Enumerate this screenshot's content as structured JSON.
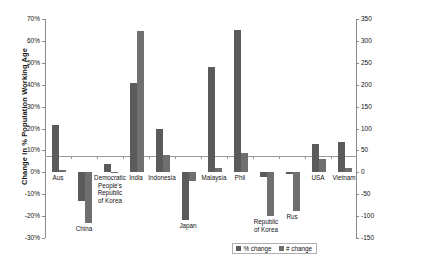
{
  "chart_data": {
    "type": "bar",
    "title": "",
    "xlabel": "",
    "ylabel": "Change in % Population Working Age",
    "y2label": "",
    "ylim": [
      -30,
      70
    ],
    "y2lim": [
      -150,
      350
    ],
    "grid": false,
    "legend_position": "bottom-right",
    "categories": [
      "Aus",
      "China",
      "Democratic\nPeople's\nRepublic\nof Korea",
      "India",
      "Indonesia",
      "Japan",
      "Malaysia",
      "Phil",
      "Republic\nof Korea",
      "Rus",
      "USA",
      "Vietnam"
    ],
    "series": [
      {
        "name": "% change",
        "axis": "left",
        "color": "#5b5b5b",
        "values": [
          21.5,
          -13.0,
          4.0,
          41.0,
          20.0,
          -22.0,
          48.0,
          65.0,
          -2.0,
          -1.0,
          13.0,
          14.0
        ]
      },
      {
        "name": "# change",
        "axis": "right",
        "color": "#6f6f6f",
        "values": [
          5,
          -115,
          0,
          322,
          40,
          -20,
          10,
          45,
          -100,
          -88,
          30,
          10
        ]
      }
    ],
    "y_ticks": [
      "70%",
      "60%",
      "50%",
      "40%",
      "30%",
      "20%",
      "10%",
      "0%",
      "-10%",
      "-20%",
      "-30%"
    ],
    "y2_ticks": [
      "350",
      "300",
      "250",
      "200",
      "150",
      "100",
      "50",
      "0",
      "-50",
      "-100",
      "-150"
    ]
  },
  "legend": {
    "items": [
      {
        "label": "% change",
        "swatch": "pct-swatch"
      },
      {
        "label": "# change",
        "swatch": "num-swatch"
      }
    ]
  }
}
